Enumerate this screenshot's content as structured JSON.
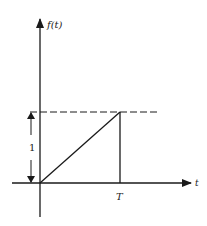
{
  "diagram": {
    "y_axis_label": "f(t)",
    "x_axis_label": "t",
    "x_tick_label": "T",
    "amplitude_label": "1",
    "colors": {
      "line": "#1a1a1a",
      "background": "#ffffff"
    },
    "elements": [
      {
        "type": "axis",
        "name": "vertical-axis",
        "direction": "up"
      },
      {
        "type": "axis",
        "name": "horizontal-axis",
        "direction": "right"
      },
      {
        "type": "line",
        "name": "ramp",
        "from": [
          0,
          0
        ],
        "to": [
          "T",
          1
        ]
      },
      {
        "type": "line",
        "name": "drop-line",
        "from": [
          "T",
          1
        ],
        "to": [
          "T",
          0
        ]
      },
      {
        "type": "dashed-line",
        "name": "level-1-reference"
      },
      {
        "type": "dimension-arrow",
        "name": "amplitude-arrow",
        "label": "1"
      }
    ]
  }
}
